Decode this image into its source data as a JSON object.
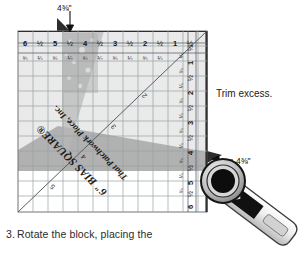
{
  "figure": {
    "ruler": {
      "brand_line_1": "6\" BIAS SQUARE®",
      "brand_line_2": "That Patchwork Place, Inc.",
      "top_scale_major": [
        "6",
        "½",
        "5",
        "½",
        "4",
        "½",
        "3",
        "½",
        "2",
        "½",
        "1",
        "½"
      ],
      "top_scale_minor": [
        "¾",
        "¼",
        "¾",
        "¼",
        "¾",
        "¼",
        "¾",
        "¼",
        "¾",
        "¼"
      ],
      "right_scale_major": [
        "½",
        "1",
        "½",
        "2",
        "½",
        "3",
        "½",
        "4",
        "½",
        "5",
        "½",
        "6"
      ],
      "right_scale_minor": [
        "¼",
        "¾",
        "¼",
        "¾",
        "¼",
        "¾",
        "¼",
        "¾",
        "¼",
        "¾"
      ],
      "diagonal_numbers": [
        "2",
        "3",
        "4",
        "5"
      ]
    },
    "labels": {
      "dimension_top": "4⅜\"",
      "dimension_right": "4⅜\"",
      "trim_excess": "Trim excess."
    },
    "caption": {
      "number": "3.",
      "text": "Rotate the block, placing the"
    },
    "colors": {
      "ruler_line": "#8f9396",
      "ruler_edge": "#3a3a3a",
      "fabric_light": "#c9c9c9",
      "fabric_mid": "#a8a8a8",
      "fabric_dark": "#2b2b2b",
      "cutter_body": "#111111",
      "cutter_handle": "#e8e8e8",
      "text": "#1c1c1c"
    }
  }
}
